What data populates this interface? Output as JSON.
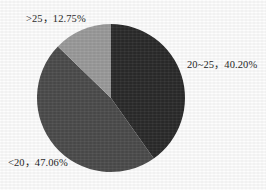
{
  "chart_data": {
    "type": "pie",
    "title": "",
    "subtitle": "",
    "xlabel": "",
    "ylabel": "",
    "grid": false,
    "legend_position": "none",
    "label_format": "category, percent",
    "categories": [
      "20~25",
      "<20",
      ">25"
    ],
    "values": [
      40.2,
      47.06,
      12.75
    ],
    "slices": [
      {
        "name": "20~25",
        "category": "20~25",
        "percent": 40.2,
        "percent_text": "40.20%",
        "label": "20~25，40.20%",
        "color": "#2b2b2b",
        "start_angle_deg": 0,
        "end_angle_deg": 144.72
      },
      {
        "name": "<20",
        "category": "<20",
        "percent": 47.06,
        "percent_text": "47.06%",
        "label": "<20，47.06%",
        "color": "#4c4c4c",
        "start_angle_deg": 144.72,
        "end_angle_deg": 314.14
      },
      {
        "name": ">25",
        "category": ">25",
        "percent": 12.75,
        "percent_text": "12.75%",
        "label": ">25，12.75%",
        "color": "#9b9b9b",
        "start_angle_deg": 314.14,
        "end_angle_deg": 360
      }
    ],
    "annotations": {
      "label_gt25": ">25，12.75%",
      "label_20_25": "20~25，40.20%",
      "label_lt20": "<20，47.06%"
    },
    "colors": {
      "slice_20_25": "#2b2b2b",
      "slice_lt20": "#4c4c4c",
      "slice_gt25": "#9b9b9b",
      "background": "#ffffff",
      "text": "#1c1c1c"
    },
    "geometry": {
      "center_x": 111,
      "center_y": 98,
      "radius": 74
    }
  }
}
